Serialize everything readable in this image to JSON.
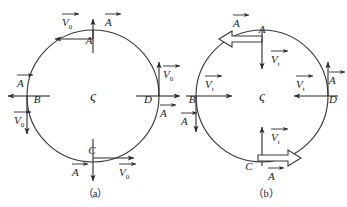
{
  "figure": {
    "background_color": "#ffffff",
    "stroke_color": "#2b2b2b",
    "panels": [
      {
        "id": "panel-a",
        "caption": "（a）",
        "center_symbol": "ς",
        "circle": {
          "cx": 93,
          "cy": 96,
          "r": 66
        },
        "point_labels": [
          {
            "name": "A",
            "text": "A",
            "x": 93,
            "y": 38,
            "position": "top"
          },
          {
            "name": "B",
            "text": "B",
            "x": 36,
            "y": 99,
            "position": "left"
          },
          {
            "name": "C",
            "text": "C",
            "x": 93,
            "y": 155,
            "position": "bottom"
          },
          {
            "name": "D",
            "text": "D",
            "x": 150,
            "y": 99,
            "position": "right"
          }
        ],
        "vectors": [
          {
            "name": "velocity-at-a",
            "symbol": "V",
            "subscript": "0",
            "direction": "left",
            "label_x": 64,
            "label_y": 22
          },
          {
            "name": "acceleration-at-a",
            "symbol": "A",
            "subscript": "",
            "direction": "up",
            "label_x": 110,
            "label_y": 22
          },
          {
            "name": "acceleration-at-b",
            "symbol": "A",
            "subscript": "",
            "direction": "left",
            "label_x": 21,
            "label_y": 82
          },
          {
            "name": "velocity-at-b",
            "symbol": "V",
            "subscript": "0",
            "direction": "down",
            "label_x": 21,
            "label_y": 122
          },
          {
            "name": "velocity-at-d",
            "symbol": "V",
            "subscript": "0",
            "direction": "up",
            "label_x": 166,
            "label_y": 78
          },
          {
            "name": "acceleration-at-d",
            "symbol": "A",
            "subscript": "",
            "direction": "right",
            "label_x": 164,
            "label_y": 117
          },
          {
            "name": "acceleration-at-c",
            "symbol": "A",
            "subscript": "",
            "direction": "down",
            "label_x": 76,
            "label_y": 176
          },
          {
            "name": "velocity-at-c",
            "symbol": "V",
            "subscript": "0",
            "direction": "right",
            "label_x": 124,
            "label_y": 176
          }
        ]
      },
      {
        "id": "panel-b",
        "caption": "（b）",
        "center_symbol": "ς",
        "circle": {
          "cx": 262,
          "cy": 96,
          "r": 66
        },
        "point_labels": [
          {
            "name": "A",
            "text": "A",
            "x": 262,
            "y": 29,
            "position": "top"
          },
          {
            "name": "B",
            "text": "B",
            "x": 194,
            "y": 99,
            "position": "left"
          },
          {
            "name": "C",
            "text": "C",
            "x": 248,
            "y": 166,
            "position": "bottom"
          },
          {
            "name": "D",
            "text": "D",
            "x": 331,
            "y": 103,
            "position": "right"
          }
        ],
        "vectors": [
          {
            "name": "acceleration-at-a",
            "symbol": "A",
            "subscript": "",
            "direction": "left",
            "style": "block-arrow",
            "label_x": 237,
            "label_y": 26
          },
          {
            "name": "velocity-at-a",
            "symbol": "V",
            "subscript": "t",
            "direction": "down",
            "label_x": 277,
            "label_y": 62
          },
          {
            "name": "velocity-at-b",
            "symbol": "V",
            "subscript": "t",
            "direction": "right",
            "label_x": 214,
            "label_y": 87
          },
          {
            "name": "acceleration-at-b",
            "symbol": "A",
            "subscript": "",
            "direction": "down",
            "label_x": 186,
            "label_y": 124
          },
          {
            "name": "velocity-at-d",
            "symbol": "V",
            "subscript": "t",
            "direction": "left",
            "label_x": 305,
            "label_y": 87
          },
          {
            "name": "acceleration-at-d",
            "symbol": "A",
            "subscript": "",
            "direction": "up",
            "label_x": 332,
            "label_y": 83
          },
          {
            "name": "velocity-at-c",
            "symbol": "V",
            "subscript": "t",
            "direction": "up",
            "label_x": 277,
            "label_y": 141
          },
          {
            "name": "acceleration-at-c",
            "symbol": "A",
            "subscript": "",
            "direction": "right",
            "style": "block-arrow",
            "label_x": 272,
            "label_y": 180
          }
        ]
      }
    ]
  }
}
